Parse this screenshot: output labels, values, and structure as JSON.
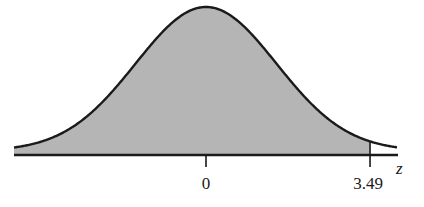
{
  "chart_data": {
    "type": "area",
    "title": "",
    "distribution": "standard normal",
    "mean": 0,
    "sd": 1,
    "xlabel": "z",
    "ylabel": "",
    "xlim": [
      -4.1,
      4.1
    ],
    "shaded_region": {
      "from": "-inf",
      "to": 3.49
    },
    "ticks": [
      {
        "value": 0,
        "label": "0"
      },
      {
        "value": 3.49,
        "label": "3.49"
      }
    ],
    "colors": {
      "fill": "#b5b5b5",
      "curve": "#1a1a1a",
      "axis": "#1a1a1a"
    },
    "grid": false,
    "legend": "none"
  }
}
